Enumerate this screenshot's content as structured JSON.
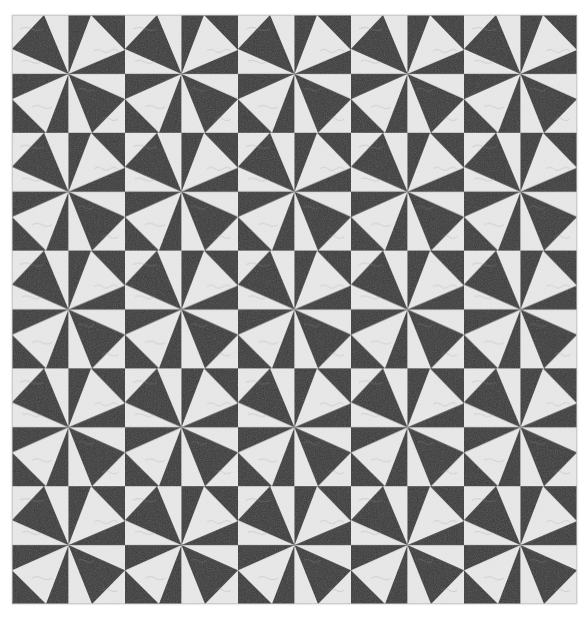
{
  "image": {
    "subject": "Black and white pinwheel signature quilt",
    "colors": {
      "background": "#ffffff",
      "dark_fabric": "#3a3a3a",
      "light_fabric": "#e9e9e9",
      "writing": "#9a9a9a"
    },
    "grid": {
      "block_columns": 5,
      "block_rows": 5,
      "cells_per_block": "2x2",
      "total_cells": "10x10"
    }
  }
}
